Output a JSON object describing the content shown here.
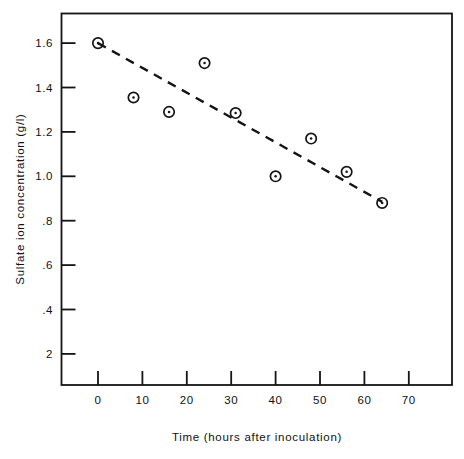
{
  "chart_data": {
    "type": "scatter",
    "title": "",
    "xlabel": "Time  (hours after inoculation)",
    "ylabel": "Sulfate ion concentration  (g/l)",
    "xlim": [
      -3,
      75
    ],
    "ylim": [
      0,
      1.72
    ],
    "grid": false,
    "legend": null,
    "xticks": [
      "0",
      "10",
      "20",
      "30",
      "40",
      "50",
      "60",
      "70"
    ],
    "xtick_values": [
      0,
      10,
      20,
      30,
      40,
      50,
      60,
      70
    ],
    "yticks": [
      "1.6",
      "1.4",
      "1.2",
      "1.0",
      ".8",
      ".6",
      ".4",
      "2"
    ],
    "ytick_values": [
      1.6,
      1.4,
      1.2,
      1.0,
      0.8,
      0.6,
      0.4,
      0.2
    ],
    "series": [
      {
        "name": "Sulfate ion concentration",
        "marker": "circle-with-center-dot",
        "x": [
          0,
          8,
          16,
          24,
          31,
          40,
          48,
          56,
          64
        ],
        "values": [
          1.6,
          1.355,
          1.29,
          1.51,
          1.285,
          1.0,
          1.17,
          1.02,
          0.88
        ]
      }
    ],
    "trendline": {
      "style": "dashed",
      "x": [
        0,
        64
      ],
      "y": [
        1.6,
        0.885
      ]
    }
  },
  "figure": {
    "frame": "full-box",
    "background_color": "#ffffff",
    "ink_color": "#141414"
  }
}
